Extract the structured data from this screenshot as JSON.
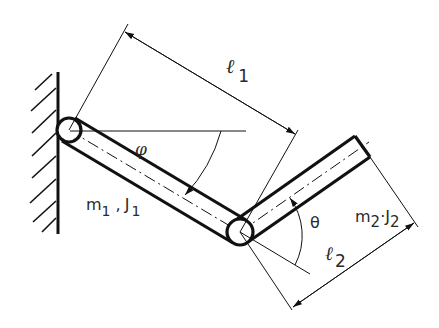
{
  "diagram": {
    "type": "double-pendulum / two-link manipulator schematic",
    "labels": {
      "l1_symbol": "ℓ",
      "l1_sub": "1",
      "l2_symbol": "ℓ",
      "l2_sub": "2",
      "phi": "φ",
      "theta": "θ",
      "m1": "m",
      "m1_sub": "1",
      "m1_sep": " ,",
      "J1": "J",
      "J1_sub": "1",
      "m2": "m",
      "m2_sub": "2",
      "m2_sep": "·",
      "J2": "J",
      "J2_sub": "2"
    },
    "colors": {
      "stroke": "#111111",
      "background": "#ffffff"
    }
  }
}
